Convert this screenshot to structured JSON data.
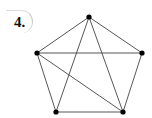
{
  "problem": {
    "number_label": "4."
  },
  "graph": {
    "vertices": [
      {
        "id": "top",
        "x": 89,
        "y": 17
      },
      {
        "id": "left",
        "x": 37,
        "y": 53
      },
      {
        "id": "right",
        "x": 142,
        "y": 53
      },
      {
        "id": "bottom-left",
        "x": 56,
        "y": 112
      },
      {
        "id": "bottom-right",
        "x": 123,
        "y": 112
      }
    ],
    "edges": [
      [
        "top",
        "left"
      ],
      [
        "top",
        "right"
      ],
      [
        "top",
        "bottom-left"
      ],
      [
        "top",
        "bottom-right"
      ],
      [
        "left",
        "right"
      ],
      [
        "left",
        "bottom-left"
      ],
      [
        "left",
        "bottom-right"
      ],
      [
        "right",
        "bottom-right"
      ],
      [
        "bottom-left",
        "bottom-right"
      ]
    ],
    "line_color": "#444444",
    "vertex_color": "#000000"
  }
}
